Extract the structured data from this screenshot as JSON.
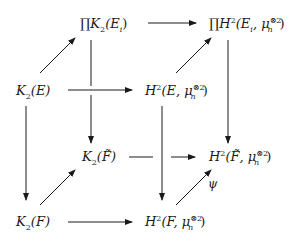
{
  "diagram": {
    "type": "commutative-diagram",
    "nodes": [
      {
        "id": "prodK2Ei",
        "prefix": "∏",
        "main": "K",
        "sub": "2",
        "arg": "(E",
        "argsub": "i",
        "close": ")"
      },
      {
        "id": "prodH2Ei",
        "prefix": "∏",
        "main": "H",
        "sup": "2",
        "arg": "(E",
        "argsub": "i",
        "sep": ", μ",
        "musub": "n",
        "musup": "⊗2",
        "close": ")"
      },
      {
        "id": "K2E",
        "main": "K",
        "sub": "2",
        "arg": "(E)"
      },
      {
        "id": "H2E",
        "main": "H",
        "sup": "2",
        "arg": "(E",
        "sep": ", μ",
        "musub": "n",
        "musup": "⊗2",
        "close": ")"
      },
      {
        "id": "K2Ftilde",
        "main": "K",
        "sub": "2",
        "arg": "(F̃)"
      },
      {
        "id": "H2Ftilde",
        "main": "H",
        "sup": "2",
        "arg": "(F̃",
        "sep": ", μ",
        "musub": "n",
        "musup": "⊗2",
        "close": ")"
      },
      {
        "id": "K2F",
        "main": "K",
        "sub": "2",
        "arg": "(F)"
      },
      {
        "id": "H2F",
        "main": "H",
        "sup": "2",
        "arg": "(F",
        "sep": ", μ",
        "musub": "n",
        "musup": "⊗2",
        "close": ")"
      }
    ],
    "edges": [
      {
        "from": "prodK2Ei",
        "to": "prodH2Ei"
      },
      {
        "from": "K2E",
        "to": "prodK2Ei"
      },
      {
        "from": "H2E",
        "to": "prodH2Ei"
      },
      {
        "from": "K2E",
        "to": "H2E"
      },
      {
        "from": "prodK2Ei",
        "to": "K2Ftilde"
      },
      {
        "from": "prodH2Ei",
        "to": "H2Ftilde"
      },
      {
        "from": "K2E",
        "to": "K2F"
      },
      {
        "from": "H2E",
        "to": "H2F"
      },
      {
        "from": "K2Ftilde",
        "to": "H2Ftilde"
      },
      {
        "from": "K2F",
        "to": "K2Ftilde"
      },
      {
        "from": "H2F",
        "to": "H2Ftilde",
        "label": "ψ"
      },
      {
        "from": "K2F",
        "to": "H2F"
      }
    ],
    "edge_label_psi": "ψ"
  }
}
